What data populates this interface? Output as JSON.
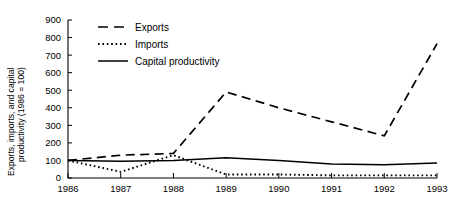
{
  "chart_data": {
    "type": "line",
    "title": "",
    "xlabel": "",
    "ylabel": "Exports, imports, and capital productivity (1986 = 100)",
    "ylabel_lines": [
      "Exports, imports, and capital",
      "productivity (1986 = 100)"
    ],
    "x": [
      1986,
      1987,
      1988,
      1989,
      1990,
      1991,
      1992,
      1993
    ],
    "categories": [
      "1986",
      "1987",
      "1988",
      "1989",
      "1990",
      "1991",
      "1992",
      "1993"
    ],
    "xlim": [
      1986,
      1993
    ],
    "ylim": [
      0,
      900
    ],
    "yticks": [
      0,
      100,
      200,
      300,
      400,
      500,
      600,
      700,
      800,
      900
    ],
    "ytick_labels": [
      "0",
      "100",
      "200",
      "300",
      "400",
      "500",
      "600",
      "700",
      "800",
      "900"
    ],
    "grid": false,
    "legend_position": "upper-left-inside",
    "series": [
      {
        "name": "Exports",
        "style": "dashed",
        "color": "#000000",
        "values": [
          100,
          130,
          140,
          490,
          400,
          320,
          240,
          765
        ]
      },
      {
        "name": "Imports",
        "style": "dotted",
        "color": "#000000",
        "values": [
          100,
          35,
          130,
          20,
          20,
          15,
          15,
          15
        ]
      },
      {
        "name": "Capital productivity",
        "style": "solid",
        "color": "#000000",
        "values": [
          100,
          95,
          100,
          115,
          100,
          80,
          75,
          85
        ]
      }
    ]
  },
  "legend": {
    "items": [
      {
        "label": "Exports",
        "style": "dashed"
      },
      {
        "label": "Imports",
        "style": "dotted"
      },
      {
        "label": "Capital productivity",
        "style": "solid"
      }
    ]
  }
}
